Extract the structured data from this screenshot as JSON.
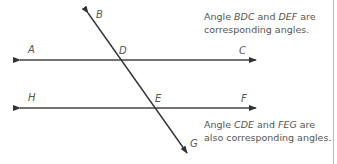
{
  "diagram": {
    "lines": [
      {
        "name": "line-AC",
        "x1": 20,
        "y1": 60,
        "x2": 256,
        "y2": 60
      },
      {
        "name": "line-HF",
        "x1": 20,
        "y1": 108,
        "x2": 256,
        "y2": 108
      },
      {
        "name": "transversal-BG",
        "x1": 88,
        "y1": 13,
        "x2": 187,
        "y2": 153
      }
    ],
    "points": {
      "A": {
        "label": "A",
        "x": 28,
        "y": 44
      },
      "B": {
        "label": "B",
        "x": 96,
        "y": 10
      },
      "C": {
        "label": "C",
        "x": 239,
        "y": 44
      },
      "D": {
        "label": "D",
        "x": 120,
        "y": 44
      },
      "H": {
        "label": "H",
        "x": 28,
        "y": 92
      },
      "E": {
        "label": "E",
        "x": 155,
        "y": 92
      },
      "F": {
        "label": "F",
        "x": 241,
        "y": 92
      },
      "G": {
        "label": "G",
        "x": 190,
        "y": 140
      }
    },
    "notes": {
      "top": {
        "line1_a": "Angle ",
        "line1_b": "BDC",
        "line1_c": " and ",
        "line1_d": "DEF",
        "line1_e": " are",
        "line2": "corresponding angles."
      },
      "bottom": {
        "line1_a": "Angle ",
        "line1_b": "CDE",
        "line1_c": " and ",
        "line1_d": "FEG",
        "line1_e": " are",
        "line2": "also corresponding angles."
      }
    },
    "colors": {
      "line": "#333333",
      "text": "#555555",
      "edge": "#bbbbbb"
    }
  }
}
